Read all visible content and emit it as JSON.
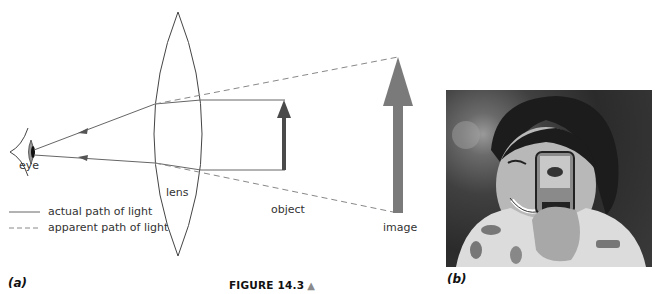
{
  "figure": {
    "caption": "FIGURE 14.3",
    "caption_icon": "up-triangle-icon",
    "panel_a_label": "(a)",
    "panel_b_label": "(b)"
  },
  "diagram": {
    "labels": {
      "eye": "eye",
      "lens": "lens",
      "object": "object",
      "image": "image"
    },
    "legend": [
      {
        "style": "solid",
        "label": "actual path of light"
      },
      {
        "style": "dashed",
        "label": "apparent path of light"
      }
    ],
    "colors": {
      "line": "#555555",
      "object_arrow": "#4a4a4a",
      "image_arrow": "#7a7a7a",
      "caption_triangle": "#8a8a8a"
    }
  },
  "photo": {
    "description": "Girl holding a magnifying lens in front of her eye"
  }
}
